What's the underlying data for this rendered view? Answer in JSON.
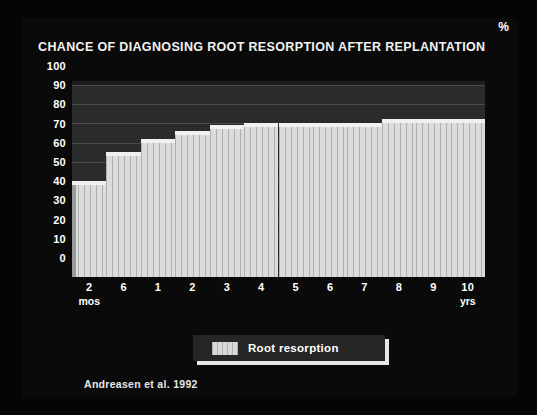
{
  "slide": {
    "title": "CHANCE OF DIAGNOSING ROOT RESORPTION AFTER REPLANTATION",
    "citation": "Andreasen et al. 1992",
    "background_color": "#0a0a0a",
    "text_color": "#ffffff"
  },
  "legend": {
    "label": "Root resorption",
    "swatch_color": "#d8d8d8",
    "position": "bottom-center"
  },
  "chart_data": {
    "type": "bar",
    "title": "CHANCE OF DIAGNOSING ROOT RESORPTION AFTER REPLANTATION",
    "subtitle": "",
    "xlabel": "",
    "ylabel": "%",
    "y_unit": "%",
    "ylim": [
      0,
      100
    ],
    "yticks": [
      0,
      10,
      20,
      30,
      40,
      50,
      60,
      70,
      80,
      90,
      100
    ],
    "grid": true,
    "legend": [
      "Root resorption"
    ],
    "series_color": "#dcdcdc",
    "categories": [
      "2 mos",
      "6 mos",
      "1 yrs",
      "2 yrs",
      "3 yrs",
      "4 yrs",
      "5 yrs",
      "6 yrs",
      "7 yrs",
      "8 yrs",
      "9 yrs",
      "10 yrs"
    ],
    "xtick_labels": [
      "2",
      "6",
      "1",
      "2",
      "3",
      "4",
      "5",
      "6",
      "7",
      "8",
      "9",
      "10"
    ],
    "xtick_units": [
      {
        "index": 0,
        "text": "mos"
      },
      {
        "index": 11,
        "text": "yrs"
      }
    ],
    "series": [
      {
        "name": "Root resorption",
        "values": [
          48,
          63,
          70,
          74,
          77,
          78,
          78,
          78,
          78,
          80,
          80,
          80
        ]
      }
    ]
  }
}
